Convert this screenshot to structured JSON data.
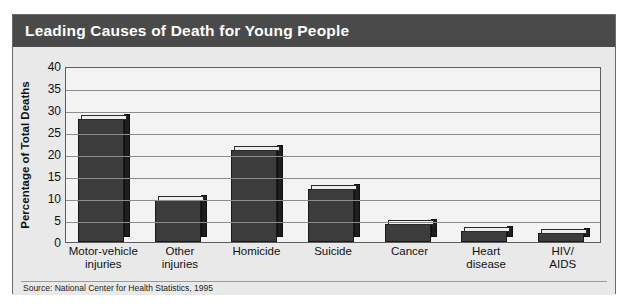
{
  "figure": {
    "title": "Leading Causes of Death for Young People",
    "source_note": "Source: National Center for Health Statistics, 1995",
    "colors": {
      "title_bar": "#4a4a4a",
      "title_text": "#ffffff",
      "figure_background": "#e8e8e8",
      "plot_background": "#f3f3f3",
      "bar_face": "#3c3c3c",
      "bar_side": "#1e1e1e",
      "bar_top": "#ededed",
      "gridline": "#8d8d8d",
      "frame_border": "#6b6b6b"
    }
  },
  "chart_data": {
    "type": "bar",
    "title": "Leading Causes of Death for Young People",
    "xlabel": "",
    "ylabel": "Percentage of Total Deaths",
    "ylim": [
      0,
      40
    ],
    "ytick_step": 5,
    "yticks": [
      40,
      35,
      30,
      25,
      20,
      15,
      10,
      5,
      0
    ],
    "ytick_labels": [
      "40",
      "35",
      "30",
      "25",
      "20",
      "15",
      "10",
      "5",
      "0"
    ],
    "grid": true,
    "legend": null,
    "categories": [
      "Motor-vehicle injuries",
      "Other injuries",
      "Homicide",
      "Suicide",
      "Cancer",
      "Heart disease",
      "HIV/AIDS"
    ],
    "category_lines": [
      [
        "Motor-vehicle",
        "injuries"
      ],
      [
        "Other",
        "injuries"
      ],
      [
        "Homicide"
      ],
      [
        "Suicide"
      ],
      [
        "Cancer"
      ],
      [
        "Heart",
        "disease"
      ],
      [
        "HIV/",
        "AIDS"
      ]
    ],
    "values": [
      28,
      9.5,
      21,
      12,
      4,
      2.5,
      2
    ],
    "units": "percent",
    "source": "Source: National Center for Health Statistics, 1995"
  }
}
